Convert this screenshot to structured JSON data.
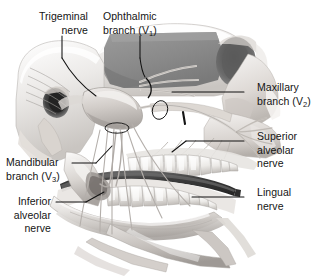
{
  "figure": {
    "type": "anatomical-illustration",
    "style": "grayscale medical illustration",
    "width": 315,
    "height": 276,
    "background_color": "#ffffff"
  },
  "labels": {
    "trigeminal": {
      "line1": "Trigeminal",
      "line2": "nerve"
    },
    "ophthalmic": {
      "line1": "Ophthalmic",
      "line2_pre": "branch (V",
      "line2_sub": "1",
      "line2_post": ")"
    },
    "maxillary": {
      "line1": "Maxillary",
      "line2_pre": "branch (V",
      "line2_sub": "2",
      "line2_post": ")"
    },
    "superior_alveolar": {
      "line1": "Superior",
      "line2": "alveolar",
      "line3": "nerve"
    },
    "lingual": {
      "line1": "Lingual",
      "line2": "nerve"
    },
    "mandibular": {
      "line1": "Mandibular",
      "line2_pre": "branch (V",
      "line2_sub": "3",
      "line2_post": ")"
    },
    "inferior_alveolar": {
      "line1": "Inferior",
      "line2": "alveolar",
      "line3": "nerve"
    }
  },
  "colors": {
    "text": "#141414",
    "leader_line": "#111111",
    "cranial_cavity_gray": "#8d8d8d",
    "orbit_dark": "#5b5b5b",
    "ear_canal_dark": "#2b2b2b",
    "lingual_nerve_dark": "#3a3a3a",
    "bone_light": "#f0eeec",
    "bone_mid": "#cfcbc7",
    "nerve_line": "#9a9a9a"
  }
}
